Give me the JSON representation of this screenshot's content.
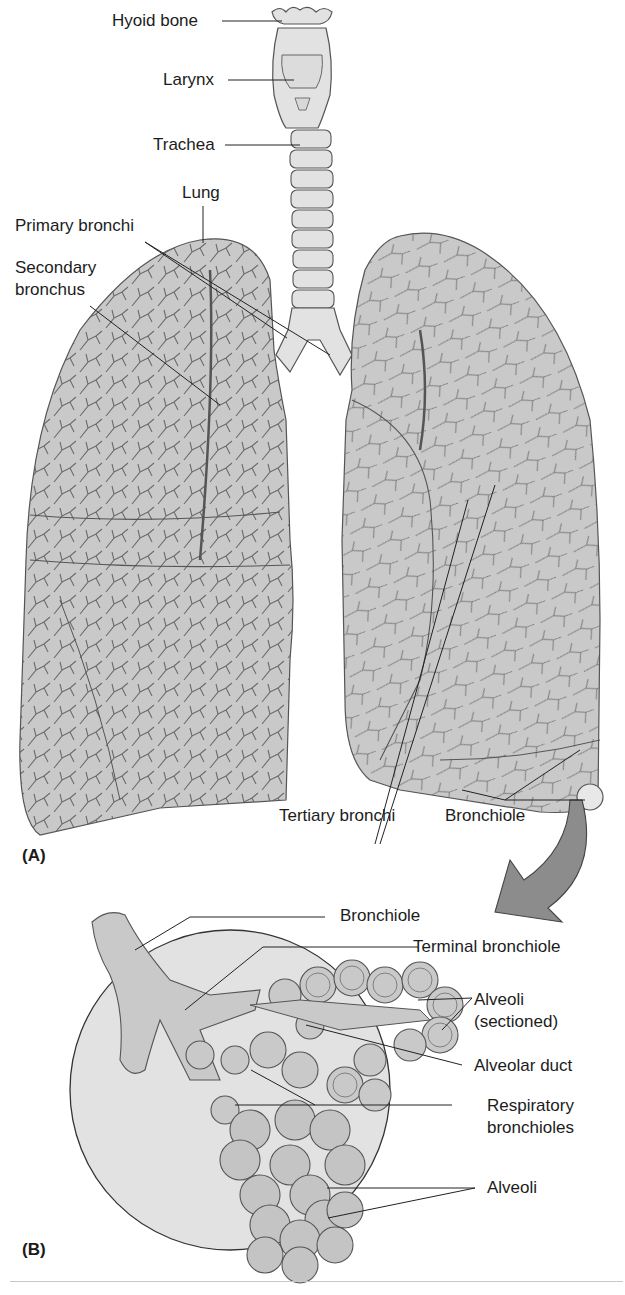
{
  "figure": {
    "panel_a": {
      "tag": "(A)",
      "labels": {
        "hyoid_bone": "Hyoid bone",
        "larynx": "Larynx",
        "trachea": "Trachea",
        "lung": "Lung",
        "primary_bronchi": "Primary bronchi",
        "secondary_bronchus_line1": "Secondary",
        "secondary_bronchus_line2": "bronchus",
        "tertiary_bronchi": "Tertiary bronchi",
        "bronchiole": "Bronchiole"
      }
    },
    "panel_b": {
      "tag": "(B)",
      "labels": {
        "bronchiole": "Bronchiole",
        "terminal_bronchiole": "Terminal bronchiole",
        "alveoli_sectioned_line1": "Alveoli",
        "alveoli_sectioned_line2": "(sectioned)",
        "alveolar_duct": "Alveolar duct",
        "respiratory_bronchioles_line1": "Respiratory",
        "respiratory_bronchioles_line2": "bronchioles",
        "alveoli": "Alveoli"
      }
    },
    "colors": {
      "tissue_fill": "#c9c9c9",
      "light_fill": "#e2e2e2",
      "outline": "#555555",
      "arrow_fill": "#8c8c8c",
      "leader_line": "#222222"
    }
  }
}
